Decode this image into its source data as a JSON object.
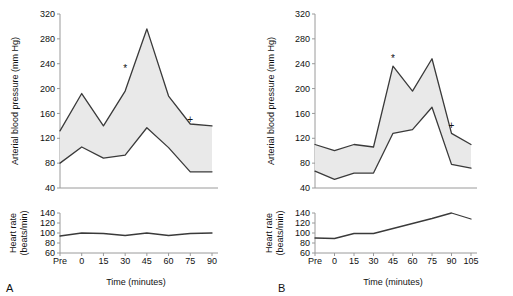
{
  "figure": {
    "panels": [
      {
        "letter": "A",
        "bp": {
          "ylabel": "Arterial blood pressure (mm Hg)",
          "yticks": [
            40,
            80,
            120,
            160,
            200,
            240,
            280,
            320
          ],
          "ylim": [
            40,
            320
          ],
          "markers": [
            {
              "glyph": "*",
              "x_category": "30",
              "y": 232
            },
            {
              "glyph": "+",
              "x_category": "75",
              "y": 150
            }
          ]
        },
        "hr": {
          "ylabel": "Heart rate (beats/min)",
          "ylabel_line1": "Heart rate",
          "ylabel_line2": "(beats/min)",
          "yticks": [
            60,
            80,
            100,
            120,
            140
          ],
          "ylim": [
            60,
            140
          ]
        },
        "xlabel": "Time (minutes)",
        "xticks": [
          "Pre",
          "0",
          "15",
          "30",
          "45",
          "60",
          "75",
          "90"
        ]
      },
      {
        "letter": "B",
        "bp": {
          "ylabel": "Arterial blood pressure (mm Hg)",
          "yticks": [
            40,
            80,
            120,
            160,
            200,
            240,
            280,
            320
          ],
          "ylim": [
            40,
            320
          ],
          "markers": [
            {
              "glyph": "*",
              "x_category": "45",
              "y": 248
            },
            {
              "glyph": "+",
              "x_category": "90",
              "y": 140
            }
          ]
        },
        "hr": {
          "ylabel": "Heart rate (beats/min)",
          "ylabel_line1": "Heart rate",
          "ylabel_line2": "(beats/min)",
          "yticks": [
            60,
            80,
            100,
            120,
            140
          ],
          "ylim": [
            60,
            140
          ]
        },
        "xlabel": "Time (minutes)",
        "xticks": [
          "Pre",
          "0",
          "15",
          "30",
          "45",
          "60",
          "75",
          "90",
          "105"
        ]
      }
    ]
  },
  "chart_data": [
    {
      "type": "area",
      "id": "panel-a-blood-pressure",
      "title": "",
      "xlabel": "Time (minutes)",
      "ylabel": "Arterial blood pressure (mm Hg)",
      "categories": [
        "Pre",
        "0",
        "15",
        "30",
        "45",
        "60",
        "75",
        "90"
      ],
      "ylim": [
        40,
        320
      ],
      "yticks": [
        40,
        80,
        120,
        160,
        200,
        240,
        280,
        320
      ],
      "grid": false,
      "legend": "none",
      "series": [
        {
          "name": "Systolic",
          "values": [
            132,
            192,
            140,
            196,
            296,
            188,
            143,
            140
          ]
        },
        {
          "name": "Diastolic",
          "values": [
            80,
            106,
            88,
            93,
            137,
            105,
            66,
            66
          ]
        }
      ],
      "band_fill": "#e9e9e9",
      "line_color": "#3a3a3a",
      "annotations": [
        {
          "glyph": "*",
          "at_category": "30",
          "value": 232
        },
        {
          "glyph": "+",
          "at_category": "75",
          "value": 150
        }
      ]
    },
    {
      "type": "line",
      "id": "panel-a-heart-rate",
      "title": "",
      "xlabel": "Time (minutes)",
      "ylabel": "Heart rate (beats/min)",
      "categories": [
        "Pre",
        "0",
        "15",
        "30",
        "45",
        "60",
        "75",
        "90"
      ],
      "ylim": [
        60,
        140
      ],
      "yticks": [
        60,
        80,
        100,
        120,
        140
      ],
      "grid": false,
      "legend": "none",
      "series": [
        {
          "name": "Heart rate",
          "values": [
            94,
            100,
            99,
            95,
            100,
            95,
            99,
            100
          ]
        }
      ],
      "line_color": "#3a3a3a"
    },
    {
      "type": "area",
      "id": "panel-b-blood-pressure",
      "title": "",
      "xlabel": "Time (minutes)",
      "ylabel": "Arterial blood pressure (mm Hg)",
      "categories": [
        "Pre",
        "0",
        "15",
        "30",
        "45",
        "60",
        "75",
        "90",
        "105"
      ],
      "ylim": [
        40,
        320
      ],
      "yticks": [
        40,
        80,
        120,
        160,
        200,
        240,
        280,
        320
      ],
      "grid": false,
      "legend": "none",
      "series": [
        {
          "name": "Systolic",
          "values": [
            110,
            100,
            110,
            106,
            236,
            196,
            248,
            128,
            110
          ]
        },
        {
          "name": "Diastolic",
          "values": [
            67,
            54,
            64,
            64,
            128,
            134,
            170,
            78,
            72
          ]
        }
      ],
      "band_fill": "#e9e9e9",
      "line_color": "#3a3a3a",
      "annotations": [
        {
          "glyph": "*",
          "at_category": "45",
          "value": 248
        },
        {
          "glyph": "+",
          "at_category": "90",
          "value": 140
        }
      ]
    },
    {
      "type": "line",
      "id": "panel-b-heart-rate",
      "title": "",
      "xlabel": "Time (minutes)",
      "ylabel": "Heart rate (beats/min)",
      "categories": [
        "Pre",
        "0",
        "15",
        "30",
        "45",
        "60",
        "75",
        "90",
        "105"
      ],
      "ylim": [
        60,
        140
      ],
      "yticks": [
        60,
        80,
        100,
        120,
        140
      ],
      "grid": false,
      "legend": "none",
      "series": [
        {
          "name": "Heart rate",
          "values": [
            90,
            89,
            99,
            99,
            109,
            119,
            129,
            140,
            128
          ]
        }
      ],
      "line_color": "#3a3a3a"
    }
  ]
}
